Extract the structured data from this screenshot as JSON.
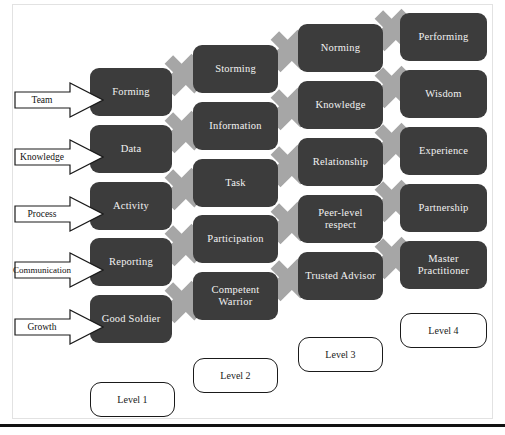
{
  "diagram": {
    "colors": {
      "stage_fill": "#3c3c3c",
      "stage_text": "#f2f2f2",
      "connector_arrow": "#a6a6a6",
      "callout_fill": "#ffffff",
      "callout_stroke": "#1a1a1a",
      "frame": "#e2e2e2",
      "rule": "#111111"
    },
    "row_labels": [
      {
        "id": "team",
        "label": "Team"
      },
      {
        "id": "knowledge",
        "label": "Knowledge"
      },
      {
        "id": "process",
        "label": "Process"
      },
      {
        "id": "communication",
        "label": "Communication"
      },
      {
        "id": "growth",
        "label": "Growth"
      }
    ],
    "rows": [
      {
        "id": "team",
        "label": "Team",
        "stages": [
          "Forming",
          "Storming",
          "Norming",
          "Performing"
        ]
      },
      {
        "id": "knowledge",
        "label": "Knowledge",
        "stages": [
          "Data",
          "Information",
          "Knowledge",
          "Wisdom"
        ]
      },
      {
        "id": "process",
        "label": "Process",
        "stages": [
          "Activity",
          "Task",
          "Relationship",
          "Experience"
        ]
      },
      {
        "id": "communication",
        "label": "Communication",
        "stages": [
          "Reporting",
          "Participation",
          "Peer-level respect",
          "Partnership"
        ]
      },
      {
        "id": "growth",
        "label": "Growth",
        "stages": [
          "Good Soldier",
          "Competent Warrior",
          "Trusted Advisor",
          "Master Practitioner"
        ]
      }
    ],
    "levels": [
      {
        "id": "level-1",
        "label": "Level 1"
      },
      {
        "id": "level-2",
        "label": "Level 2"
      },
      {
        "id": "level-3",
        "label": "Level 3"
      },
      {
        "id": "level-4",
        "label": "Level 4"
      }
    ]
  }
}
